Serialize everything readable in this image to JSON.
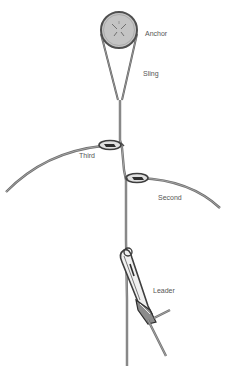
{
  "diagram": {
    "type": "climbing-anchor-system",
    "labels": {
      "anchor": "Anchor",
      "sling": "Sling",
      "third": "Third",
      "second": "Second",
      "leader": "Leader"
    },
    "colors": {
      "anchor_fill": "#c4c4c4",
      "anchor_stroke": "#555555",
      "rope": "#6e6e6e",
      "rope_highlight": "#bdbdbd",
      "carabiner": "#4a4a4a",
      "label": "#555555"
    }
  }
}
